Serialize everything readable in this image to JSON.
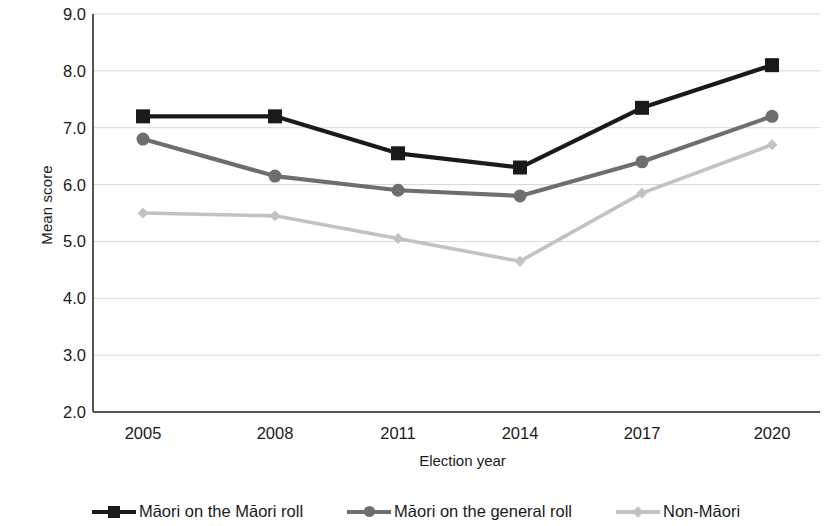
{
  "chart_data": {
    "type": "line",
    "title": "",
    "xlabel": "Election year",
    "ylabel": "Mean score",
    "categories": [
      "2005",
      "2008",
      "2011",
      "2014",
      "2017",
      "2020"
    ],
    "x": [
      2005,
      2008,
      2011,
      2014,
      2017,
      2020
    ],
    "xlim": [
      2005,
      2020
    ],
    "ylim": [
      2.0,
      9.0
    ],
    "yticks": [
      "9.0",
      "8.0",
      "7.0",
      "6.0",
      "5.0",
      "4.0",
      "3.0",
      "2.0"
    ],
    "ytick_values": [
      9.0,
      8.0,
      7.0,
      6.0,
      5.0,
      4.0,
      3.0,
      2.0
    ],
    "grid": true,
    "grid_axis": "y",
    "legend_position": "bottom",
    "series": [
      {
        "name": "Māori on the Māori roll",
        "values": [
          7.2,
          7.2,
          6.55,
          6.3,
          7.35,
          8.1
        ],
        "color": "#1a1a1a",
        "marker": "square"
      },
      {
        "name": "Māori on the general roll",
        "values": [
          6.8,
          6.15,
          5.9,
          5.8,
          6.4,
          7.2
        ],
        "color": "#6e6e6e",
        "marker": "circle"
      },
      {
        "name": "Non-Māori",
        "values": [
          5.5,
          5.45,
          5.05,
          4.65,
          5.85,
          6.7
        ],
        "color": "#c2c2c2",
        "marker": "diamond"
      }
    ]
  },
  "axes": {
    "y_title": "Mean score",
    "x_title": "Election year"
  },
  "legend": {
    "items": [
      {
        "label": "Māori on the Māori roll"
      },
      {
        "label": "Māori on the general roll"
      },
      {
        "label": "Non-Māori"
      }
    ]
  }
}
